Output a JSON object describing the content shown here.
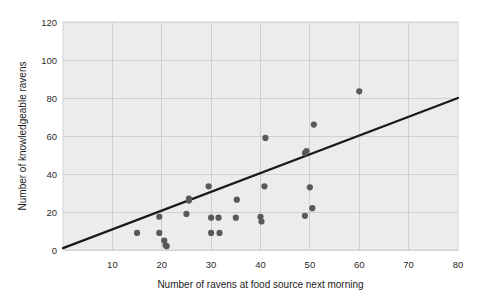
{
  "chart_data": {
    "type": "scatter",
    "title": "",
    "subtitle": "",
    "xlabel": "Number of ravens at food source next morning",
    "ylabel": "Number of knowledgeable ravens",
    "xlim": [
      0,
      80
    ],
    "ylim": [
      0,
      120
    ],
    "xticks": [
      10,
      20,
      30,
      40,
      50,
      60,
      70,
      80
    ],
    "xtick_labels": [
      "10",
      "20",
      "30",
      "40",
      "50",
      "60",
      "70",
      "80"
    ],
    "yticks": [
      0,
      20,
      40,
      60,
      80,
      100,
      120
    ],
    "ytick_labels": [
      "0",
      "20",
      "40",
      "60",
      "80",
      "100",
      "120"
    ],
    "grid": true,
    "grid_axis": "both",
    "legend": false,
    "legend_position": "none",
    "point_color": "#595959",
    "line_color": "#1a1a1a",
    "plot_background": "#ececec",
    "figure_background": "#ffffff",
    "series": [
      {
        "name": "ravens",
        "marker": "circle",
        "points": [
          {
            "x": 15,
            "y": 9
          },
          {
            "x": 19.5,
            "y": 17.5
          },
          {
            "x": 19.5,
            "y": 9
          },
          {
            "x": 20.5,
            "y": 5
          },
          {
            "x": 20.8,
            "y": 2.5
          },
          {
            "x": 21,
            "y": 2
          },
          {
            "x": 25,
            "y": 19
          },
          {
            "x": 25.5,
            "y": 27
          },
          {
            "x": 25.5,
            "y": 26
          },
          {
            "x": 29.5,
            "y": 33.5
          },
          {
            "x": 30,
            "y": 17
          },
          {
            "x": 30,
            "y": 9
          },
          {
            "x": 31.5,
            "y": 17
          },
          {
            "x": 31.7,
            "y": 9
          },
          {
            "x": 35,
            "y": 17
          },
          {
            "x": 35.2,
            "y": 26.5
          },
          {
            "x": 40,
            "y": 17.5
          },
          {
            "x": 40.2,
            "y": 15
          },
          {
            "x": 40.8,
            "y": 33.5
          },
          {
            "x": 41,
            "y": 59
          },
          {
            "x": 49,
            "y": 18
          },
          {
            "x": 49,
            "y": 51
          },
          {
            "x": 49.3,
            "y": 52
          },
          {
            "x": 50,
            "y": 33
          },
          {
            "x": 50.5,
            "y": 22
          },
          {
            "x": 50.8,
            "y": 66
          },
          {
            "x": 60,
            "y": 83.5
          }
        ]
      }
    ],
    "trendline": {
      "name": "regression-line",
      "x_start": 0,
      "y_start": 1,
      "x_end": 80,
      "y_end": 80
    }
  }
}
